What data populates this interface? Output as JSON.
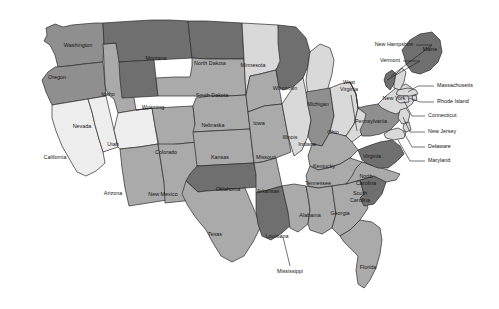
{
  "map": {
    "title": "United States choropleth map",
    "background_color": "#ffffff",
    "border_color": "#2b2b2b",
    "shades": {
      "very_light": "#eeeeee",
      "light": "#d9d9d9",
      "medium": "#aaaaaa",
      "medium_dark": "#8f8f8f",
      "dark": "#6f6f6f",
      "water": "#ffffff"
    },
    "states": [
      {
        "id": "WA",
        "label": "Washington",
        "shade": "medium_dark",
        "label_x": 78,
        "label_y": 46
      },
      {
        "id": "OR",
        "label": "Oregon",
        "shade": "medium_dark",
        "label_x": 57,
        "label_y": 78
      },
      {
        "id": "CA",
        "label": "California",
        "shade": "very_light",
        "label_x": 55,
        "label_y": 158
      },
      {
        "id": "NV",
        "label": "Nevada",
        "shade": "very_light",
        "label_x": 82,
        "label_y": 127
      },
      {
        "id": "ID",
        "label": "Idaho",
        "shade": "medium",
        "label_x": 108,
        "label_y": 95
      },
      {
        "id": "UT",
        "label": "Utah",
        "shade": "very_light",
        "label_x": 113,
        "label_y": 145
      },
      {
        "id": "AZ",
        "label": "Arizona",
        "shade": "medium",
        "label_x": 113,
        "label_y": 194
      },
      {
        "id": "MT",
        "label": "Montana",
        "shade": "dark",
        "label_x": 156,
        "label_y": 59
      },
      {
        "id": "WY",
        "label": "Wyoming",
        "shade": "dark",
        "label_x": 153,
        "label_y": 108
      },
      {
        "id": "CO",
        "label": "Colorado",
        "shade": "medium",
        "label_x": 166,
        "label_y": 153
      },
      {
        "id": "NM",
        "label": "New Mexico",
        "shade": "medium",
        "label_x": 163,
        "label_y": 195
      },
      {
        "id": "ND",
        "label": "North Dakota",
        "shade": "dark",
        "label_x": 210,
        "label_y": 64
      },
      {
        "id": "SD",
        "label": "South Dakota",
        "shade": "medium",
        "label_x": 212,
        "label_y": 96
      },
      {
        "id": "NE",
        "label": "Nebraska",
        "shade": "medium",
        "label_x": 213,
        "label_y": 126
      },
      {
        "id": "KS",
        "label": "Kansas",
        "shade": "medium",
        "label_x": 220,
        "label_y": 158
      },
      {
        "id": "OK",
        "label": "Oklahoma",
        "shade": "dark",
        "label_x": 228,
        "label_y": 190
      },
      {
        "id": "TX",
        "label": "Texas",
        "shade": "medium",
        "label_x": 215,
        "label_y": 235
      },
      {
        "id": "MN",
        "label": "Minnesota",
        "shade": "light",
        "label_x": 253,
        "label_y": 66
      },
      {
        "id": "IA",
        "label": "Iowa",
        "shade": "medium",
        "label_x": 259,
        "label_y": 124
      },
      {
        "id": "MO",
        "label": "Missouri",
        "shade": "medium",
        "label_x": 266,
        "label_y": 158
      },
      {
        "id": "AR",
        "label": "Arkansas",
        "shade": "medium",
        "label_x": 268,
        "label_y": 192
      },
      {
        "id": "LA",
        "label": "Louisiana",
        "shade": "dark",
        "label_x": 277,
        "label_y": 237
      },
      {
        "id": "WI",
        "label": "Wisconsin",
        "shade": "dark",
        "label_x": 285,
        "label_y": 89
      },
      {
        "id": "IL",
        "label": "Illinois",
        "shade": "light",
        "label_x": 290,
        "label_y": 138
      },
      {
        "id": "MI",
        "label": "Michigan",
        "shade": "light",
        "label_x": 318,
        "label_y": 105
      },
      {
        "id": "IN",
        "label": "Indiana",
        "shade": "medium_dark",
        "label_x": 307,
        "label_y": 145
      },
      {
        "id": "OH",
        "label": "Ohio",
        "shade": "light",
        "label_x": 333,
        "label_y": 133
      },
      {
        "id": "KY",
        "label": "Kentucky",
        "shade": "medium",
        "label_x": 324,
        "label_y": 167
      },
      {
        "id": "TN",
        "label": "Tennessee",
        "shade": "medium",
        "label_x": 318,
        "label_y": 184
      },
      {
        "id": "MS",
        "label": "Mississippi",
        "shade": "medium",
        "label_x": 290,
        "label_y": 210
      },
      {
        "id": "AL",
        "label": "Alabama",
        "shade": "medium",
        "label_x": 310,
        "label_y": 216
      },
      {
        "id": "GA",
        "label": "Georgia",
        "shade": "medium",
        "label_x": 340,
        "label_y": 214
      },
      {
        "id": "FL",
        "label": "Florida",
        "shade": "medium",
        "label_x": 368,
        "label_y": 268
      },
      {
        "id": "SC",
        "label": "South Carolina",
        "shade": "dark",
        "label_x": 360,
        "label_y": 197
      },
      {
        "id": "NC",
        "label": "North Carolina",
        "shade": "medium",
        "label_x": 366,
        "label_y": 180
      },
      {
        "id": "VA",
        "label": "Virginia",
        "shade": "dark",
        "label_x": 372,
        "label_y": 157
      },
      {
        "id": "WV",
        "label": "West Virginia",
        "shade": "light",
        "label_x": 349,
        "label_y": 85
      },
      {
        "id": "PA",
        "label": "Pennsylvania",
        "shade": "medium_dark",
        "label_x": 371,
        "label_y": 122
      },
      {
        "id": "NY",
        "label": "New York",
        "shade": "light",
        "label_x": 394,
        "label_y": 99
      },
      {
        "id": "VT",
        "label": "Vermont",
        "shade": "dark",
        "label_x": 388,
        "label_y": 62
      },
      {
        "id": "NH",
        "label": "New Hampshire",
        "shade": "light",
        "label_x": 381,
        "label_y": 46
      },
      {
        "id": "ME",
        "label": "Maine",
        "shade": "dark",
        "label_x": 430,
        "label_y": 50
      },
      {
        "id": "MA",
        "label": "Massachusetts",
        "shade": "light",
        "label_x": 437,
        "label_y": 87
      },
      {
        "id": "RI",
        "label": "Rhode Island",
        "shade": "light",
        "label_x": 433,
        "label_y": 103
      },
      {
        "id": "CT",
        "label": "Connecticut",
        "shade": "light",
        "label_x": 430,
        "label_y": 117
      },
      {
        "id": "NJ",
        "label": "New Jersey",
        "shade": "light",
        "label_x": 425,
        "label_y": 133
      },
      {
        "id": "DE",
        "label": "Delaware",
        "shade": "light",
        "label_x": 426,
        "label_y": 148
      },
      {
        "id": "MD",
        "label": "Maryland",
        "shade": "light",
        "label_x": 424,
        "label_y": 162
      }
    ],
    "callouts": [
      {
        "id": "NH",
        "label": "New Hampshire",
        "align": "left",
        "text_x": 413,
        "text_y": 45,
        "points": "416,45 432,45 391,76"
      },
      {
        "id": "VT",
        "label": "Vermont",
        "align": "left",
        "text_x": 400,
        "text_y": 61,
        "points": "403,61 420,61 387,80"
      },
      {
        "id": "MA",
        "label": "Massachusetts",
        "align": "right",
        "text_x": 437,
        "text_y": 86,
        "points": "434,86 418,86 408,92"
      },
      {
        "id": "RI",
        "label": "Rhode Island",
        "align": "right",
        "text_x": 437,
        "text_y": 102,
        "points": "434,102 420,102 409,98"
      },
      {
        "id": "CT",
        "label": "Connecticut",
        "align": "right",
        "text_x": 428,
        "text_y": 116,
        "points": "425,116 412,116 404,101"
      },
      {
        "id": "NJ",
        "label": "New Jersey",
        "align": "right",
        "text_x": 428,
        "text_y": 132,
        "points": "425,132 410,132 403,117"
      },
      {
        "id": "DE",
        "label": "Delaware",
        "align": "right",
        "text_x": 428,
        "text_y": 147,
        "points": "425,147 412,147 403,131"
      },
      {
        "id": "MD",
        "label": "Maryland",
        "align": "right",
        "text_x": 428,
        "text_y": 161,
        "points": "425,161 410,161 398,140"
      },
      {
        "id": "WV",
        "label": "West Virginia",
        "align": "center",
        "text_x": 349,
        "text_y": 83,
        "points": "351,95 357,131"
      },
      {
        "id": "MS",
        "label": "Mississippi",
        "align": "center",
        "text_x": 290,
        "text_y": 272,
        "points": "290,266 283,237"
      }
    ]
  }
}
